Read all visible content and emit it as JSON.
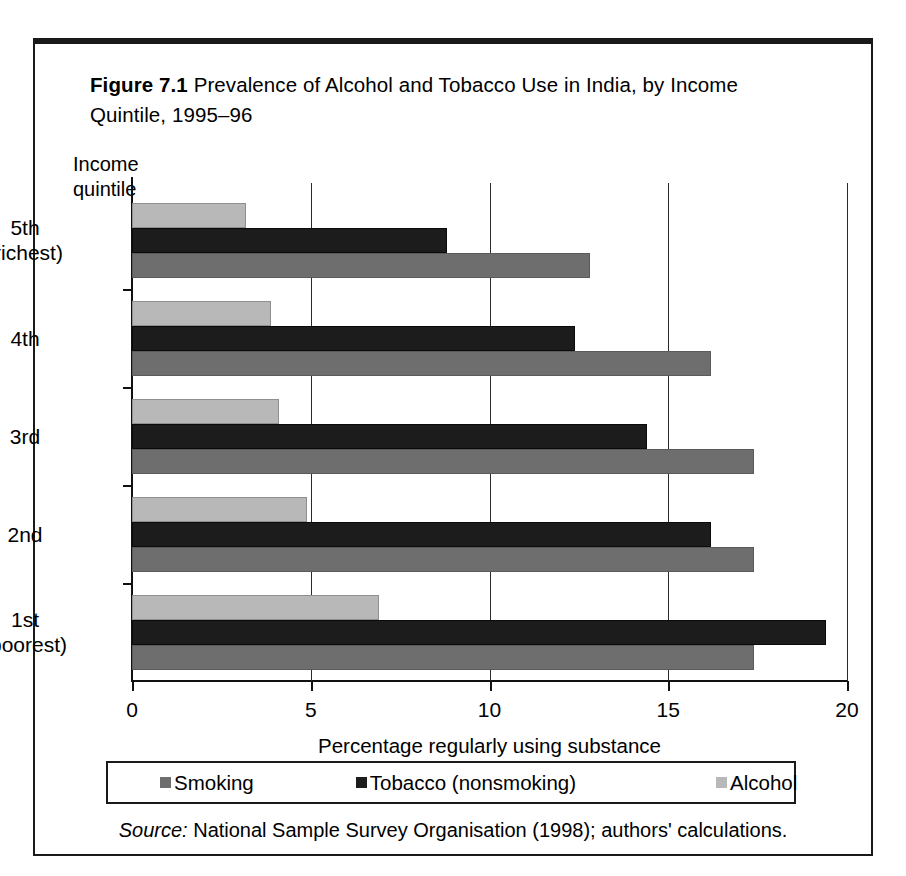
{
  "figure": {
    "number_label": "Figure 7.1",
    "title_rest": " Prevalence of Alcohol and Tobacco Use in India, by Income Quintile, 1995–96",
    "source_label": "Source:",
    "source_text": " National Sample Survey Organisation (1998); authors' calculations."
  },
  "chart_data": {
    "type": "bar",
    "orientation": "horizontal",
    "title": "Figure 7.1 Prevalence of Alcohol and Tobacco Use in India, by Income Quintile, 1995–96",
    "xlabel": "Percentage regularly using substance",
    "ylabel": "Income quintile",
    "categories": [
      "5th (richest)",
      "4th",
      "3rd",
      "2nd",
      "1st (poorest)"
    ],
    "category_lines": [
      [
        "5th",
        "(richest)"
      ],
      [
        "4th"
      ],
      [
        "3rd"
      ],
      [
        "2nd"
      ],
      [
        "1st",
        "(poorest)"
      ]
    ],
    "series": [
      {
        "name": "Smoking",
        "color": "#6e6e6e",
        "values": [
          12.8,
          16.2,
          17.4,
          17.4,
          17.4
        ]
      },
      {
        "name": "Tobacco (nonsmoking)",
        "color": "#1c1c1c",
        "values": [
          8.8,
          12.4,
          14.4,
          16.2,
          19.4
        ]
      },
      {
        "name": "Alcohol",
        "color": "#b8b8b8",
        "values": [
          3.2,
          3.9,
          4.1,
          4.9,
          6.9
        ]
      }
    ],
    "xlim": [
      0,
      20
    ],
    "xticks": [
      0,
      5,
      10,
      15,
      20
    ],
    "xtick_labels": [
      "0",
      "5",
      "10",
      "15",
      "20"
    ],
    "grid": true,
    "legend_position": "bottom"
  }
}
